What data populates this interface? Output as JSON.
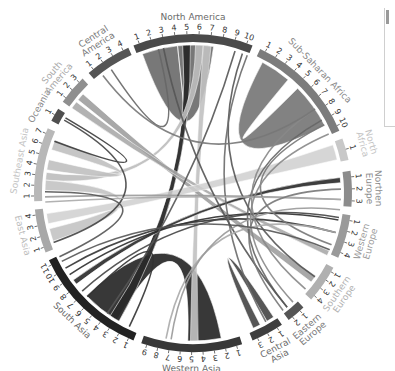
{
  "chart_data": {
    "type": "chord",
    "title": "",
    "center": [
      193,
      193
    ],
    "radius_inner": 151,
    "radius_outer": 159,
    "regions": [
      {
        "name": "North America",
        "label_lines": [
          "North America"
        ],
        "start": -22,
        "end": 22,
        "ticks": 10,
        "color": "#4a4a4a",
        "label_color": "#6a6a6a"
      },
      {
        "name": "Sub-Saharan Africa",
        "label_lines": [
          "Sub-Saharan Africa"
        ],
        "start": 25,
        "end": 67,
        "ticks": 10,
        "color": "#7c7c7c",
        "label_color": "#8a8a8a"
      },
      {
        "name": "North Africa",
        "label_lines": [
          "North",
          "Africa"
        ],
        "start": 70,
        "end": 78,
        "ticks": 1,
        "color": "#c8c8c8",
        "label_color": "#c4c4c4"
      },
      {
        "name": "Northern Europe",
        "label_lines": [
          "Northen",
          "Europe"
        ],
        "start": 82,
        "end": 95,
        "ticks": 3,
        "color": "#8c8c8c",
        "label_color": "#8a8a8a"
      },
      {
        "name": "Western Europe",
        "label_lines": [
          "Western",
          "Europe"
        ],
        "start": 98,
        "end": 114,
        "ticks": 4,
        "color": "#9a9a9a",
        "label_color": "#9a9a9a"
      },
      {
        "name": "Southern Europe",
        "label_lines": [
          "Southern",
          "Europe"
        ],
        "start": 118,
        "end": 132,
        "ticks": 4,
        "color": "#b0b0b0",
        "label_color": "#b0b0b0"
      },
      {
        "name": "Eastern Europe",
        "label_lines": [
          "Eastern",
          "Europe"
        ],
        "start": 136,
        "end": 143,
        "ticks": 2,
        "color": "#555555",
        "label_color": "#7a7a7a"
      },
      {
        "name": "Central Asia",
        "label_lines": [
          "Central",
          "Asia"
        ],
        "start": 146,
        "end": 158,
        "ticks": 3,
        "color": "#3e3e3e",
        "label_color": "#6a6a6a"
      },
      {
        "name": "Western Asia",
        "label_lines": [
          "Western Asia"
        ],
        "start": 162,
        "end": 199,
        "ticks": 9,
        "color": "#383838",
        "label_color": "#6a6a6a"
      },
      {
        "name": "South Asia",
        "label_lines": [
          "South Asia"
        ],
        "start": 202,
        "end": 245,
        "ticks": 11,
        "color": "#222222",
        "label_color": "#6a6a6a"
      },
      {
        "name": "East Asia",
        "label_lines": [
          "East Asia"
        ],
        "start": 248,
        "end": 264,
        "ticks": 4,
        "color": "#a8a8a8",
        "label_color": "#bdbdbd"
      },
      {
        "name": "Southeast Asia",
        "label_lines": [
          "Southeast Asia"
        ],
        "start": 267,
        "end": 294,
        "ticks": 7,
        "color": "#b8b8b8",
        "label_color": "#c4c4c4"
      },
      {
        "name": "Oceania",
        "label_lines": [
          "Oceania"
        ],
        "start": 297,
        "end": 302,
        "ticks": 1,
        "color": "#4f4f4f",
        "label_color": "#8a8a8a"
      },
      {
        "name": "South America",
        "label_lines": [
          "South",
          "America"
        ],
        "start": 305,
        "end": 316,
        "ticks": 3,
        "color": "#8f8f8f",
        "label_color": "#a8a8a8"
      },
      {
        "name": "Central America",
        "label_lines": [
          "Central",
          "America"
        ],
        "start": 319,
        "end": 336,
        "ticks": 4,
        "color": "#555555",
        "label_color": "#7a7a7a"
      }
    ],
    "ribbons": [
      {
        "from": [
          -20,
          -6
        ],
        "to": [
          -6,
          8
        ],
        "color": "#6a6a6a",
        "kind": "self",
        "opacity": 0.9
      },
      {
        "from": [
          28,
          40
        ],
        "to": [
          45,
          63
        ],
        "color": "#7c7c7c",
        "kind": "self",
        "opacity": 0.95
      },
      {
        "from": [
          169,
          182
        ],
        "to": [
          211,
          226
        ],
        "color": "#2e2e2e",
        "kind": "band",
        "opacity": 0.95
      },
      {
        "from": [
          147,
          150
        ],
        "to": [
          153,
          156
        ],
        "color": "#454545",
        "kind": "self",
        "opacity": 0.9
      },
      {
        "from": [
          -4,
          -1
        ],
        "to": [
          210,
          214
        ],
        "color": "#2a2a2a",
        "kind": "band",
        "opacity": 0.95
      },
      {
        "from": [
          1,
          4
        ],
        "to": [
          275,
          278
        ],
        "color": "#bdbdbd",
        "kind": "band",
        "opacity": 0.9
      },
      {
        "from": [
          4,
          7
        ],
        "to": [
          178,
          181
        ],
        "color": "#c2c2c2",
        "kind": "band",
        "opacity": 0.9
      },
      {
        "from": [
          309,
          312
        ],
        "to": [
          124,
          127
        ],
        "color": "#9a9a9a",
        "kind": "band",
        "opacity": 0.85
      },
      {
        "from": [
          305,
          308
        ],
        "to": [
          113,
          115
        ],
        "color": "#a0a0a0",
        "kind": "band",
        "opacity": 0.8
      },
      {
        "from": [
          271,
          275
        ],
        "to": [
          251,
          256
        ],
        "color": "#c4c4c4",
        "kind": "band",
        "opacity": 0.9
      },
      {
        "from": [
          279,
          283
        ],
        "to": [
          287,
          291
        ],
        "color": "#c0c0c0",
        "kind": "band",
        "opacity": 0.9
      },
      {
        "from": [
          71,
          77
        ],
        "to": [
          258,
          262
        ],
        "color": "#d0d0d0",
        "kind": "band",
        "opacity": 0.85
      },
      {
        "from": [
          84,
          86
        ],
        "to": [
          232,
          234
        ],
        "color": "#2a2a2a",
        "kind": "band",
        "opacity": 0.9
      },
      {
        "from": [
          100,
          101
        ],
        "to": [
          236,
          237
        ],
        "color": "#2c2c2c",
        "kind": "line"
      },
      {
        "from": [
          105,
          106
        ],
        "to": [
          239,
          240
        ],
        "color": "#333333",
        "kind": "line"
      },
      {
        "from": [
          99,
          100
        ],
        "to": [
          228,
          229
        ],
        "color": "#444444",
        "kind": "line"
      },
      {
        "from": [
          92,
          93
        ],
        "to": [
          268,
          269
        ],
        "color": "#9a9a9a",
        "kind": "line"
      },
      {
        "from": [
          16,
          17
        ],
        "to": [
          215,
          216
        ],
        "color": "#555555",
        "kind": "line"
      },
      {
        "from": [
          19,
          20
        ],
        "to": [
          124,
          125
        ],
        "color": "#555555",
        "kind": "line"
      },
      {
        "from": [
          21,
          22
        ],
        "to": [
          150,
          151
        ],
        "color": "#6a6a6a",
        "kind": "line"
      },
      {
        "from": [
          60,
          61
        ],
        "to": [
          140,
          141
        ],
        "color": "#666666",
        "kind": "line"
      },
      {
        "from": [
          62,
          63
        ],
        "to": [
          110,
          111
        ],
        "color": "#777777",
        "kind": "line"
      },
      {
        "from": [
          55,
          56
        ],
        "to": [
          130,
          131
        ],
        "color": "#888888",
        "kind": "line"
      },
      {
        "from": [
          -12,
          -11
        ],
        "to": [
          140,
          141
        ],
        "color": "#555555",
        "kind": "line"
      },
      {
        "from": [
          300,
          301
        ],
        "to": [
          290,
          291
        ],
        "color": "#3a3a3a",
        "kind": "line"
      },
      {
        "from": [
          299,
          300
        ],
        "to": [
          250,
          251
        ],
        "color": "#444444",
        "kind": "line"
      },
      {
        "from": [
          326,
          327
        ],
        "to": [
          -14,
          -13
        ],
        "color": "#666666",
        "kind": "line"
      },
      {
        "from": [
          322,
          323
        ],
        "to": [
          55,
          56
        ],
        "color": "#777777",
        "kind": "line"
      },
      {
        "from": [
          266,
          267
        ],
        "to": [
          92,
          93
        ],
        "color": "#aaaaaa",
        "kind": "line"
      },
      {
        "from": [
          270,
          271
        ],
        "to": [
          244,
          245
        ],
        "color": "#555555",
        "kind": "line"
      },
      {
        "from": [
          137,
          138
        ],
        "to": [
          66,
          67
        ],
        "color": "#888888",
        "kind": "line"
      },
      {
        "from": [
          142,
          143
        ],
        "to": [
          88,
          89
        ],
        "color": "#777777",
        "kind": "line"
      },
      {
        "from": [
          190,
          191
        ],
        "to": [
          105,
          106
        ],
        "color": "#aaaaaa",
        "kind": "line"
      },
      {
        "from": [
          188,
          189
        ],
        "to": [
          96,
          97
        ],
        "color": "#999999",
        "kind": "line"
      },
      {
        "from": [
          205,
          206
        ],
        "to": [
          225,
          226
        ],
        "color": "#333333",
        "kind": "line"
      },
      {
        "from": [
          242,
          243
        ],
        "to": [
          112,
          113
        ],
        "color": "#555555",
        "kind": "line"
      }
    ]
  }
}
